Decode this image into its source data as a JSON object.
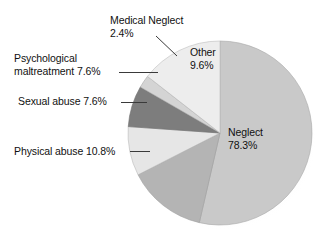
{
  "chart_data": {
    "type": "pie",
    "title": "",
    "subtitle": "",
    "xlabel": "",
    "ylabel": "",
    "legend_position": "none",
    "grid": false,
    "value_unit": "%",
    "total": 316.3,
    "categories": [
      "Neglect",
      "Physical abuse",
      "Sexual abuse",
      "Psychological maltreatment",
      "Medical Neglect",
      "Other"
    ],
    "values": [
      78.3,
      10.8,
      7.6,
      7.6,
      2.4,
      9.6
    ],
    "slices": [
      {
        "name": "Neglect",
        "label": "Neglect",
        "value": 78.3,
        "value_text": "78.3%",
        "color": "#c9c9c9",
        "label_placement": "inside",
        "start_angle_deg": 0,
        "end_angle_deg": 193
      },
      {
        "name": "Physical abuse",
        "label": "Physical abuse",
        "value": 10.8,
        "value_text": "10.8%",
        "color": "#b4b4b4",
        "label_placement": "outside-left",
        "start_angle_deg": 193,
        "end_angle_deg": 243
      },
      {
        "name": "Sexual abuse",
        "label": "Sexual abuse",
        "value": 7.6,
        "value_text": "7.6%",
        "color": "#e6e6e6",
        "label_placement": "outside-left",
        "start_angle_deg": 243,
        "end_angle_deg": 274
      },
      {
        "name": "Psychological maltreatment",
        "label": "Psychological maltreatment",
        "value": 7.6,
        "value_text": "7.6%",
        "color": "#7d7d7d",
        "label_placement": "outside-left",
        "start_angle_deg": 274,
        "end_angle_deg": 300
      },
      {
        "name": "Medical Neglect",
        "label": "Medical Neglect",
        "value": 2.4,
        "value_text": "2.4%",
        "color": "#d4d4d4",
        "label_placement": "outside-top",
        "start_angle_deg": 300,
        "end_angle_deg": 308
      },
      {
        "name": "Other",
        "label": "Other",
        "value": 9.6,
        "value_text": "9.6%",
        "color": "#ededed",
        "label_placement": "inside",
        "start_angle_deg": 308,
        "end_angle_deg": 360
      }
    ]
  },
  "labels": {
    "medical_neglect": "Medical Neglect\n2.4%",
    "psychological": "Psychological\nmaltreatment 7.6%",
    "sexual_abuse": "Sexual abuse 7.6%",
    "physical_abuse": "Physical abuse 10.8%",
    "other": "Other\n9.6%",
    "neglect": "Neglect\n78.3%"
  },
  "colors": {
    "background": "#ffffff",
    "text": "#111111",
    "leader_line": "#3a3a3a",
    "slice_outline": "#9a9a9a",
    "shadow": "#d8d8d8"
  }
}
